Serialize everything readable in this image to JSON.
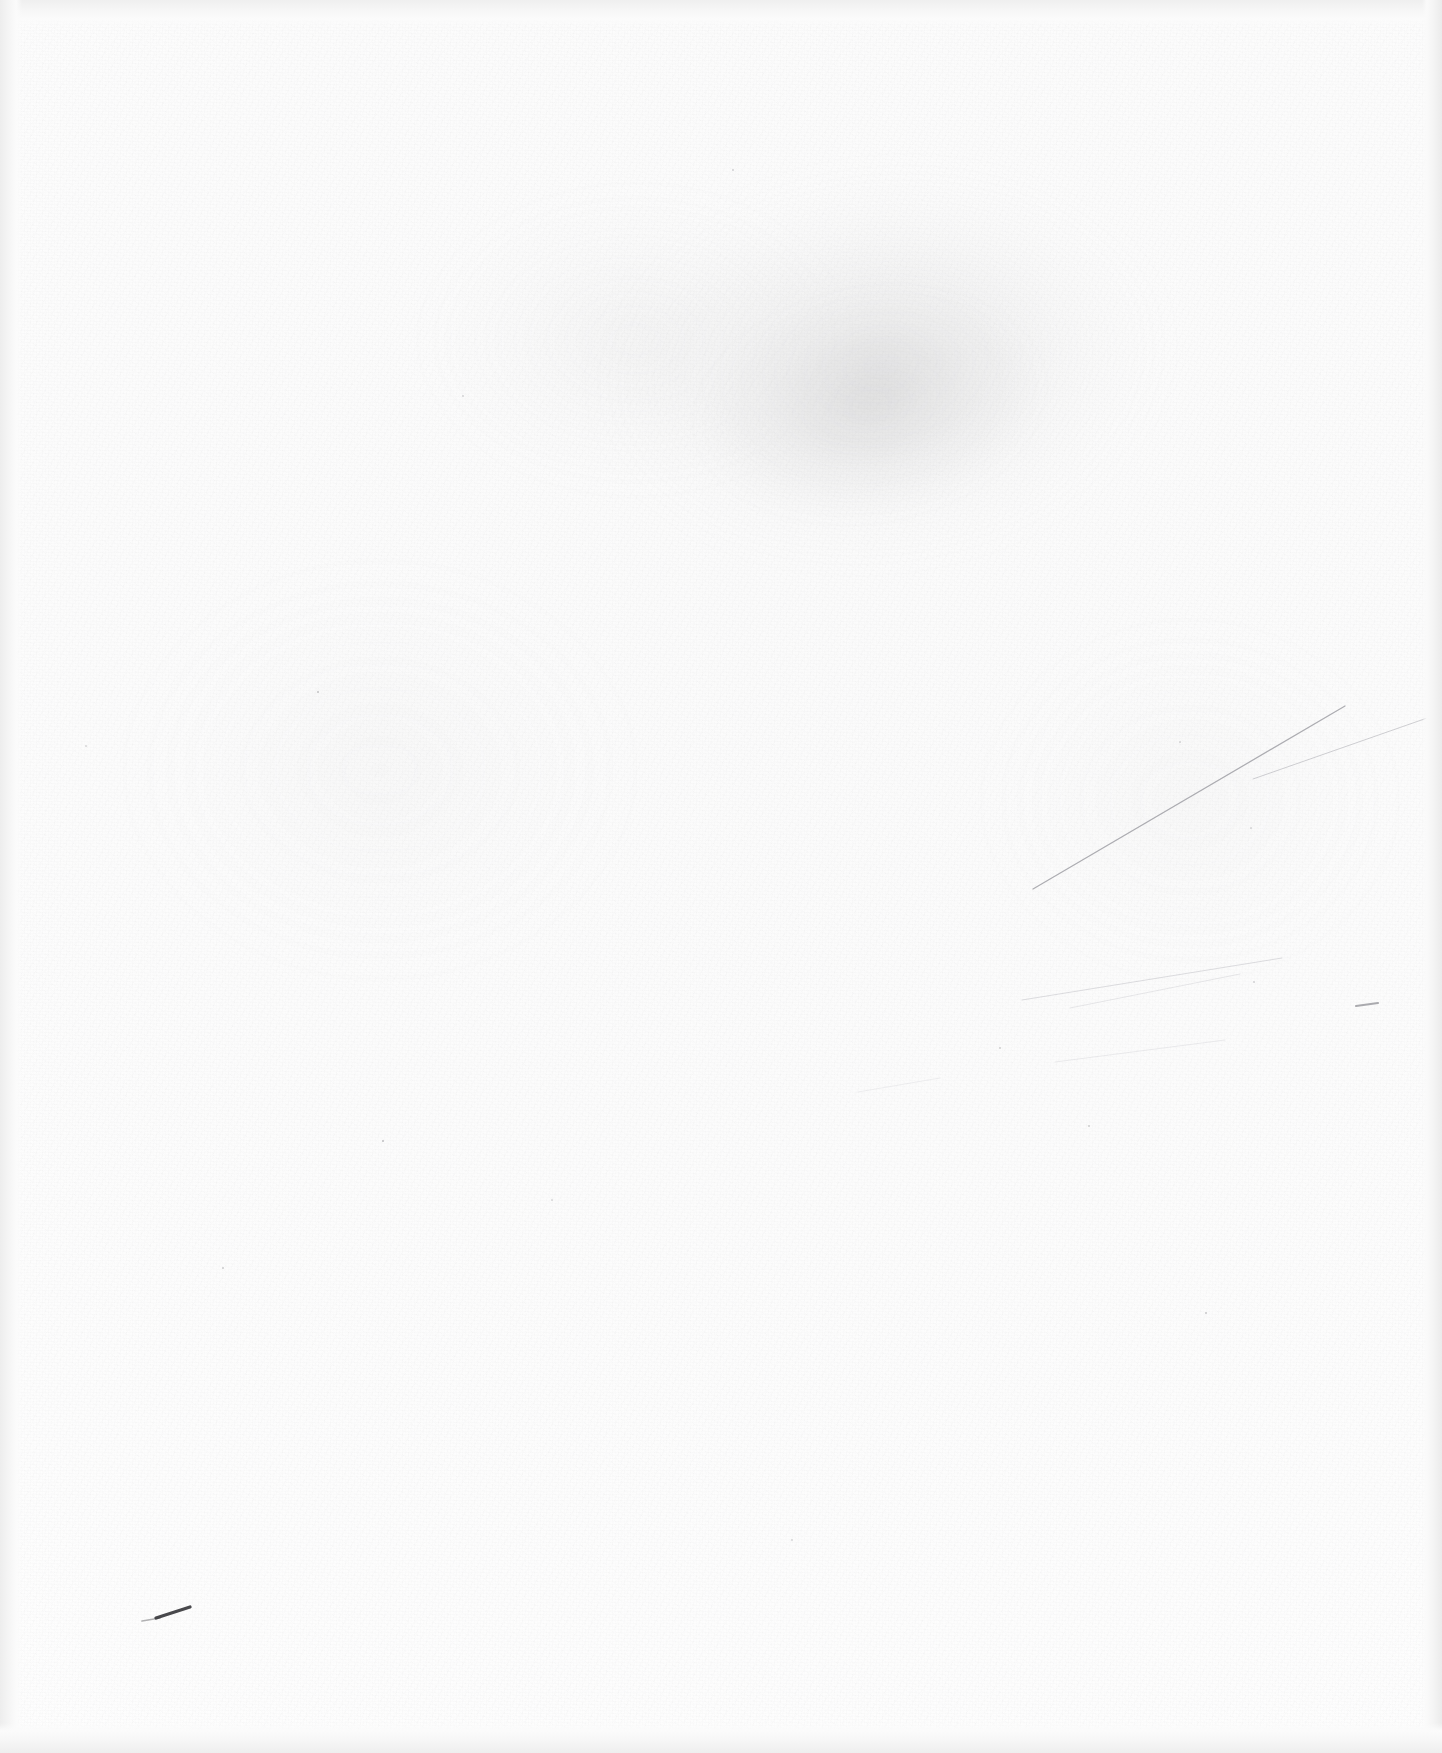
{
  "document": {
    "kind": "scanned-page",
    "description": "Blank scanned page with paper grain, faint toner smudge and light pencil marks",
    "page_width": 1442,
    "page_height": 1753,
    "text_content": "",
    "has_text": false,
    "colors": {
      "paper": "#fdfdfd",
      "paper_shade": "#fbfbfb",
      "edge_band": "#ededed",
      "smudge": "#969698",
      "pencil_dark": "#3a3a3e",
      "pencil_faint": "#b6b6ba",
      "speck": "#8e8e92"
    }
  },
  "marks": {
    "smudge_label": "toner-smudge",
    "pencil_dash_label": "pencil-dash",
    "scratch_label": "scratch-line",
    "dark_dash": {
      "x1": 156,
      "y1": 1618,
      "x2": 190,
      "y2": 1607,
      "width": 3.2,
      "color": "#3a3a3e"
    },
    "scratch_lines": [
      {
        "name": "scratch-primary",
        "x1": 1033,
        "y1": 889,
        "x2": 1345,
        "y2": 706,
        "width": 1.25,
        "color": "#9a9aa0",
        "opacity": 0.8
      },
      {
        "name": "scratch-primary-b",
        "x1": 1253,
        "y1": 779,
        "x2": 1430,
        "y2": 717,
        "width": 1.0,
        "color": "#b0b0b6",
        "opacity": 0.6
      },
      {
        "name": "scratch-secondary",
        "x1": 1022,
        "y1": 1000,
        "x2": 1282,
        "y2": 958,
        "width": 1.0,
        "color": "#bcbcc2",
        "opacity": 0.5
      },
      {
        "name": "scratch-secondary-b",
        "x1": 1070,
        "y1": 1008,
        "x2": 1240,
        "y2": 974,
        "width": 0.9,
        "color": "#c4c4ca",
        "opacity": 0.42
      },
      {
        "name": "scratch-tertiary",
        "x1": 1055,
        "y1": 1062,
        "x2": 1225,
        "y2": 1040,
        "width": 0.9,
        "color": "#c8c8ce",
        "opacity": 0.38
      },
      {
        "name": "scratch-tick",
        "x1": 1356,
        "y1": 1006,
        "x2": 1378,
        "y2": 1003,
        "width": 2.0,
        "color": "#8c8c92",
        "opacity": 0.72
      },
      {
        "name": "scratch-low",
        "x1": 858,
        "y1": 1092,
        "x2": 940,
        "y2": 1078,
        "width": 0.9,
        "color": "#cfcfd4",
        "opacity": 0.35
      }
    ],
    "specks": [
      {
        "name": "speck-1",
        "x": 318,
        "y": 692,
        "size": 2.4,
        "opacity": 0.5
      },
      {
        "name": "speck-2",
        "x": 383,
        "y": 1141,
        "size": 2.6,
        "opacity": 0.55
      },
      {
        "name": "speck-3",
        "x": 223,
        "y": 1268,
        "size": 2.2,
        "opacity": 0.45
      },
      {
        "name": "speck-4",
        "x": 1206,
        "y": 1313,
        "size": 2.3,
        "opacity": 0.48
      },
      {
        "name": "speck-5",
        "x": 1089,
        "y": 1126,
        "size": 2.0,
        "opacity": 0.42
      },
      {
        "name": "speck-6",
        "x": 1000,
        "y": 1048,
        "size": 1.9,
        "opacity": 0.4
      },
      {
        "name": "speck-7",
        "x": 733,
        "y": 170,
        "size": 2.1,
        "opacity": 0.38
      },
      {
        "name": "speck-8",
        "x": 463,
        "y": 396,
        "size": 1.8,
        "opacity": 0.34
      },
      {
        "name": "speck-9",
        "x": 1254,
        "y": 982,
        "size": 1.9,
        "opacity": 0.36
      },
      {
        "name": "speck-10",
        "x": 792,
        "y": 1540,
        "size": 1.8,
        "opacity": 0.32
      },
      {
        "name": "speck-11",
        "x": 1251,
        "y": 828,
        "size": 1.7,
        "opacity": 0.3
      },
      {
        "name": "speck-12",
        "x": 86,
        "y": 746,
        "size": 1.8,
        "opacity": 0.32
      },
      {
        "name": "speck-13",
        "x": 552,
        "y": 1200,
        "size": 1.7,
        "opacity": 0.28
      },
      {
        "name": "speck-14",
        "x": 1180,
        "y": 742,
        "size": 1.7,
        "opacity": 0.3
      }
    ]
  }
}
